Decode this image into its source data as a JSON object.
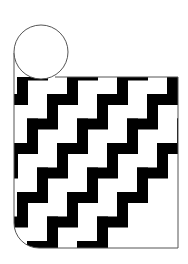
{
  "figure": {
    "field_pattern": "stepped diagonal bands, sinister-rising",
    "charge": "plain roundel (argent)",
    "stripe_count_visible": 8
  },
  "colors": {
    "background": "#ffffff",
    "stripe": "#000000",
    "field": "#ffffff",
    "outline": "#555555",
    "roundel_fill": "#ffffff"
  }
}
